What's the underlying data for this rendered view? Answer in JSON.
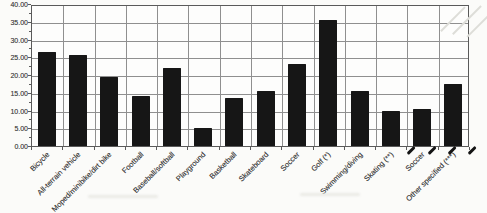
{
  "chart_data": {
    "type": "bar",
    "title": "",
    "xlabel": "",
    "ylabel": "",
    "categories": [
      "Bicycle",
      "All-terrain vehicle",
      "Moped/minibike/dirt bike",
      "Football",
      "Baseball/softball",
      "Playground",
      "Basketball",
      "Skateboard",
      "Soccer",
      "Golf (*)",
      "Swimming/diving",
      "Skating (**)",
      "Soccer",
      "Other specified (***)"
    ],
    "values": [
      26.5,
      25.5,
      19.5,
      14,
      22,
      5,
      13.5,
      15.5,
      23,
      35.5,
      15.5,
      10,
      10.5,
      17.5
    ],
    "ylim": [
      0,
      40
    ],
    "ytick_step": 5,
    "ytick_labels": [
      "40.00",
      "35.00",
      "30.00",
      "25.00",
      "20.00",
      "15.00",
      "10.00",
      "5.00",
      "0.00"
    ],
    "grid": "both",
    "legend": "none",
    "colors": {
      "bar": "#161616",
      "grid": "#8f8f8f",
      "axis_border": "#5a5a5a",
      "tick_label": "#4a4a4a",
      "background": "#fbfbf9"
    }
  }
}
